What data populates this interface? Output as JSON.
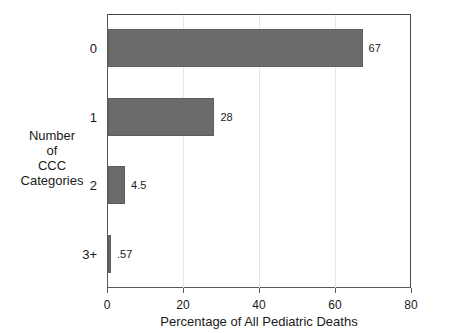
{
  "chart_data": {
    "type": "bar",
    "orientation": "horizontal",
    "title": "",
    "xlabel": "Percentage of All Pediatric Deaths",
    "ylabel": "Number of CCC Categories",
    "ylabel_lines": [
      "Number",
      "of",
      "CCC",
      "Categories"
    ],
    "categories": [
      "0",
      "1",
      "2",
      "3+"
    ],
    "values": [
      67,
      28,
      4.5,
      0.57
    ],
    "value_labels": [
      "67",
      "28",
      "4.5",
      ".57"
    ],
    "xlim": [
      0,
      80
    ],
    "xticks": [
      0,
      20,
      40,
      60,
      80
    ],
    "xtick_labels": [
      "0",
      "20",
      "40",
      "60",
      "80"
    ],
    "grid": "vertical-light",
    "legend": "none",
    "bar_color": "#6b6b6b",
    "bar_edge_color": "#5e5e5e",
    "gridline_color": "#e6e6e6",
    "axis_color": "#5a5a5a",
    "background": "#ffffff"
  }
}
